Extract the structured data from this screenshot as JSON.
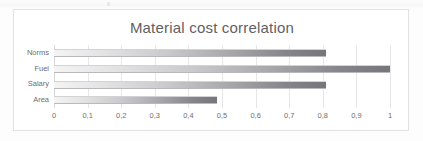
{
  "chart_data": {
    "type": "bar",
    "orientation": "horizontal",
    "title": "Material cost correlation",
    "xlabel": "",
    "ylabel": "",
    "categories": [
      "Norms",
      "Fuel",
      "Salary",
      "Area"
    ],
    "values": [
      0.81,
      1.0,
      0.81,
      0.485
    ],
    "xlim": [
      0,
      1
    ],
    "xticks": [
      0,
      0.1,
      0.2,
      0.3,
      0.4,
      0.5,
      0.6,
      0.7,
      0.8,
      0.9,
      1
    ],
    "xtick_labels": [
      "0",
      "0,1",
      "0,2",
      "0,3",
      "0,4",
      "0,5",
      "0,6",
      "0,7",
      "0,8",
      "0,9",
      "1"
    ],
    "grid": true,
    "grid_axis": "x",
    "legend": false,
    "bar_fill": "gradient-light-to-dark-gray",
    "colors": {
      "bar_start": "#f4f4f5",
      "bar_end": "#75757a",
      "gridline": "#e6e6e8",
      "border": "#e2e2e4",
      "text": "#6e6e72",
      "title_text": "#5f5f63",
      "background": "#ffffff"
    }
  }
}
